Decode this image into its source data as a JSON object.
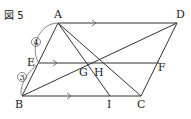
{
  "figure": {
    "title": "図 5",
    "points": {
      "A": {
        "label": "A",
        "x": 58,
        "y": 23
      },
      "D": {
        "label": "D",
        "x": 177,
        "y": 23
      },
      "B": {
        "label": "B",
        "x": 22,
        "y": 96
      },
      "C": {
        "label": "C",
        "x": 141,
        "y": 96
      },
      "E": {
        "label": "E",
        "x": 39,
        "y": 63
      },
      "F": {
        "label": "F",
        "x": 159,
        "y": 63
      },
      "G": {
        "label": "G",
        "x": 85,
        "y": 63
      },
      "H": {
        "label": "H",
        "x": 97,
        "y": 63
      },
      "I": {
        "label": "I",
        "x": 110,
        "y": 96
      }
    },
    "segments": [
      "AD",
      "BC",
      "AB",
      "DC",
      "EF",
      "BD",
      "AI",
      "AC"
    ],
    "parallel_marks": [
      "AD",
      "EF",
      "BC"
    ],
    "ratios": {
      "AE": "4",
      "EB": "3"
    }
  }
}
